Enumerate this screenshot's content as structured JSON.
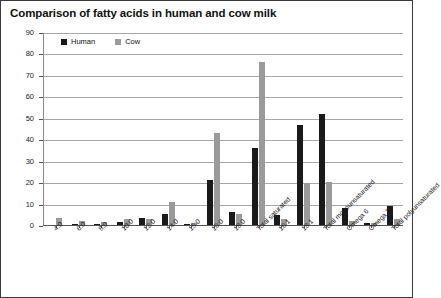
{
  "chart_data": {
    "type": "bar",
    "title": "Comparison of fatty acids in human and cow milk",
    "xlabel": "",
    "ylabel": "Per cent of total fat",
    "ylim": [
      0,
      90
    ],
    "ytick_step": 10,
    "yticks": [
      "90",
      "80",
      "70",
      "60",
      "50",
      "40",
      "30",
      "20",
      "10",
      "0"
    ],
    "grid": true,
    "legend_position": "top-left-inside",
    "categories": [
      "4:0",
      "6:0",
      "8:0",
      "10:0",
      "12:0",
      "14:0",
      "15:0",
      "16:0",
      "18:0",
      "Total saturated",
      "16:1",
      "18:1",
      "Total monounsaturated",
      "Omega 6",
      "Omega 3",
      "Total polyunsaturated"
    ],
    "series": [
      {
        "name": "Human",
        "color": "#1a1a1a",
        "values": [
          0,
          0.1,
          0.3,
          1.3,
          3.1,
          5.1,
          0.3,
          21.0,
          5.9,
          36.0,
          4.5,
          46.5,
          52.0,
          7.8,
          0.9,
          9.0
        ]
      },
      {
        "name": "Cow",
        "color": "#9a9a9a",
        "values": [
          3.3,
          2.0,
          1.2,
          2.6,
          2.9,
          10.9,
          1.1,
          43.0,
          5.1,
          76.0,
          2.9,
          19.5,
          20.0,
          1.8,
          0.8,
          3.0
        ]
      }
    ]
  },
  "legend": {
    "entries": [
      {
        "label": "Human",
        "color": "#1a1a1a"
      },
      {
        "label": "Cow",
        "color": "#9a9a9a"
      }
    ]
  },
  "colors": {
    "human": "#1a1a1a",
    "cow": "#9a9a9a",
    "gridline": "#a8a8a8",
    "axis": "#555555",
    "frame_border": "#3a3a3a",
    "background": "#ffffff",
    "text": "#111111"
  }
}
